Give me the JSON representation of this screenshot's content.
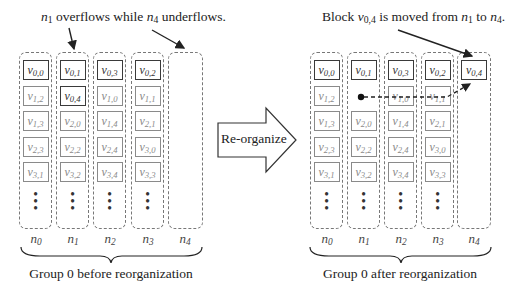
{
  "left_panel": {
    "annotation": {
      "n_overflow": "n",
      "n_overflow_sub": "1",
      "mid": " overflows while ",
      "n_underflow": "n",
      "n_underflow_sub": "4",
      "tail": " underflows."
    },
    "caption": "Group 0 before reorganization",
    "columns": [
      {
        "label": "n",
        "sub": "0",
        "blocks": [
          {
            "v": "v",
            "sub": "0,0",
            "dark": true
          },
          {
            "v": "v",
            "sub": "1,2"
          },
          {
            "v": "v",
            "sub": "1,3"
          },
          {
            "v": "v",
            "sub": "2,3"
          },
          {
            "v": "v",
            "sub": "3,1"
          }
        ]
      },
      {
        "label": "n",
        "sub": "1",
        "blocks": [
          {
            "v": "v",
            "sub": "0,1",
            "dark": true
          },
          {
            "v": "v",
            "sub": "0,4",
            "dark": true
          },
          {
            "v": "v",
            "sub": "2,0"
          },
          {
            "v": "v",
            "sub": "2,2"
          },
          {
            "v": "v",
            "sub": "3,2"
          }
        ]
      },
      {
        "label": "n",
        "sub": "2",
        "blocks": [
          {
            "v": "v",
            "sub": "0,3",
            "dark": true
          },
          {
            "v": "v",
            "sub": "1,0"
          },
          {
            "v": "v",
            "sub": "1,4"
          },
          {
            "v": "v",
            "sub": "2,4"
          },
          {
            "v": "v",
            "sub": "3,4"
          }
        ]
      },
      {
        "label": "n",
        "sub": "3",
        "blocks": [
          {
            "v": "v",
            "sub": "0,2",
            "dark": true
          },
          {
            "v": "v",
            "sub": "1,1"
          },
          {
            "v": "v",
            "sub": "2,1"
          },
          {
            "v": "v",
            "sub": "3,0"
          },
          {
            "v": "v",
            "sub": "3,3"
          }
        ]
      },
      {
        "label": "n",
        "sub": "4",
        "blocks": []
      }
    ]
  },
  "center_arrow": {
    "label": "Re-organize"
  },
  "right_panel": {
    "annotation": {
      "pre": "Block ",
      "v": "v",
      "v_sub": "0,4",
      "mid": " is moved from ",
      "n_from": "n",
      "n_from_sub": "1",
      "to": " to ",
      "n_to": "n",
      "n_to_sub": "4",
      "tail": "."
    },
    "caption": "Group 0 after reorganization",
    "columns": [
      {
        "label": "n",
        "sub": "0",
        "blocks": [
          {
            "v": "v",
            "sub": "0,0",
            "dark": true
          },
          {
            "v": "v",
            "sub": "1,2"
          },
          {
            "v": "v",
            "sub": "1,3"
          },
          {
            "v": "v",
            "sub": "2,3"
          },
          {
            "v": "v",
            "sub": "3,1"
          }
        ]
      },
      {
        "label": "n",
        "sub": "1",
        "blocks": [
          {
            "v": "v",
            "sub": "0,1",
            "dark": true
          },
          null,
          {
            "v": "v",
            "sub": "2,0"
          },
          {
            "v": "v",
            "sub": "2,2"
          },
          {
            "v": "v",
            "sub": "3,2"
          }
        ]
      },
      {
        "label": "n",
        "sub": "2",
        "blocks": [
          {
            "v": "v",
            "sub": "0,3",
            "dark": true
          },
          {
            "v": "v",
            "sub": "1,0"
          },
          {
            "v": "v",
            "sub": "1,4"
          },
          {
            "v": "v",
            "sub": "2,4"
          },
          {
            "v": "v",
            "sub": "3,4"
          }
        ]
      },
      {
        "label": "n",
        "sub": "3",
        "blocks": [
          {
            "v": "v",
            "sub": "0,2",
            "dark": true
          },
          {
            "v": "v",
            "sub": "1,1"
          },
          {
            "v": "v",
            "sub": "2,1"
          },
          {
            "v": "v",
            "sub": "3,0"
          },
          {
            "v": "v",
            "sub": "3,3"
          }
        ]
      },
      {
        "label": "n",
        "sub": "4",
        "blocks": [
          {
            "v": "v",
            "sub": "0,4",
            "dark": true
          }
        ]
      }
    ]
  },
  "colors": {
    "dark_border": "#3a3a3a",
    "light_border": "#8a8a8a",
    "dashed": "#777777"
  }
}
